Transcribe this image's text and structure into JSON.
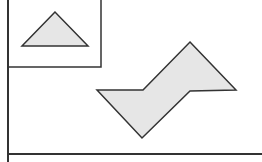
{
  "diagram": {
    "stroke_color": "#333333",
    "fill_color": "#e6e6e6",
    "background": "#ffffff",
    "inset_box": {
      "x": 8,
      "y": 0,
      "width": 93,
      "height": 67
    },
    "triangle": {
      "points": "55,12 22,46 88,46"
    },
    "lightning_shape": {
      "points": "190,42 236,90 190,91 142,138 97,90 143,90"
    },
    "left_rule": {
      "x": 8,
      "y1": 0,
      "y2": 162
    },
    "bottom_rule": {
      "x1": 8,
      "x2": 262,
      "y": 154
    }
  }
}
